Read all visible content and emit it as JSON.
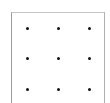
{
  "diagram": {
    "type": "dot-grid",
    "rows": 3,
    "cols": 3,
    "dots": [
      {
        "x": 27,
        "y": 28
      },
      {
        "x": 58,
        "y": 28
      },
      {
        "x": 89,
        "y": 28
      },
      {
        "x": 27,
        "y": 58
      },
      {
        "x": 58,
        "y": 58
      },
      {
        "x": 89,
        "y": 58
      },
      {
        "x": 27,
        "y": 89
      },
      {
        "x": 58,
        "y": 89
      },
      {
        "x": 89,
        "y": 89
      }
    ],
    "dot_color": "#111111",
    "border_color": "#9a9a9a"
  }
}
